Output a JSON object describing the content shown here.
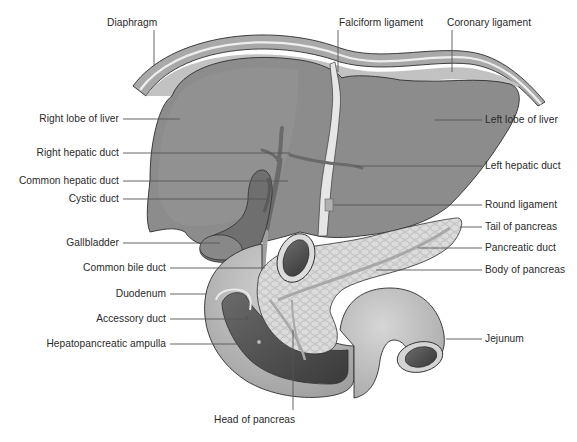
{
  "diagram": {
    "colors": {
      "liver": "#8a8a8a",
      "liver_outline": "#2e2e2e",
      "diaphragm": "#a9a9a9",
      "diaphragm_inner": "#e8e8e8",
      "ligament": "#dedede",
      "gallbladder": "#6f6f6f",
      "duct": "#6a6a6a",
      "duodenum": "#c4c4c4",
      "duodenum_lumen": "#4a4a4a",
      "pancreas": "#d9d9d9",
      "pancreatic_duct": "#a8a8a8",
      "jejunum": "#bdbdbd",
      "leader_line": "#555555",
      "text": "#2a2a2a"
    },
    "labels_top": [
      {
        "id": "diaphragm",
        "text": "Diaphragm"
      },
      {
        "id": "falciform-ligament",
        "text": "Falciform ligament"
      },
      {
        "id": "coronary-ligament",
        "text": "Coronary ligament"
      }
    ],
    "labels_left": [
      {
        "id": "right-lobe-of-liver",
        "text": "Right lobe of liver"
      },
      {
        "id": "right-hepatic-duct",
        "text": "Right hepatic duct"
      },
      {
        "id": "common-hepatic-duct",
        "text": "Common hepatic duct"
      },
      {
        "id": "cystic-duct",
        "text": "Cystic duct"
      },
      {
        "id": "gallbladder",
        "text": "Gallbladder"
      },
      {
        "id": "common-bile-duct",
        "text": "Common bile duct"
      },
      {
        "id": "duodenum",
        "text": "Duodenum"
      },
      {
        "id": "accessory-duct",
        "text": "Accessory duct"
      },
      {
        "id": "hepatopancreatic-ampulla",
        "text": "Hepatopancreatic ampulla"
      }
    ],
    "labels_right": [
      {
        "id": "left-lobe-of-liver",
        "text": "Left lobe of liver"
      },
      {
        "id": "left-hepatic-duct",
        "text": "Left hepatic duct"
      },
      {
        "id": "round-ligament",
        "text": "Round ligament"
      },
      {
        "id": "tail-of-pancreas",
        "text": "Tail of pancreas"
      },
      {
        "id": "pancreatic-duct",
        "text": "Pancreatic duct"
      },
      {
        "id": "body-of-pancreas",
        "text": "Body of pancreas"
      },
      {
        "id": "jejunum",
        "text": "Jejunum"
      }
    ],
    "labels_bottom": [
      {
        "id": "head-of-pancreas",
        "text": "Head of pancreas"
      }
    ]
  }
}
